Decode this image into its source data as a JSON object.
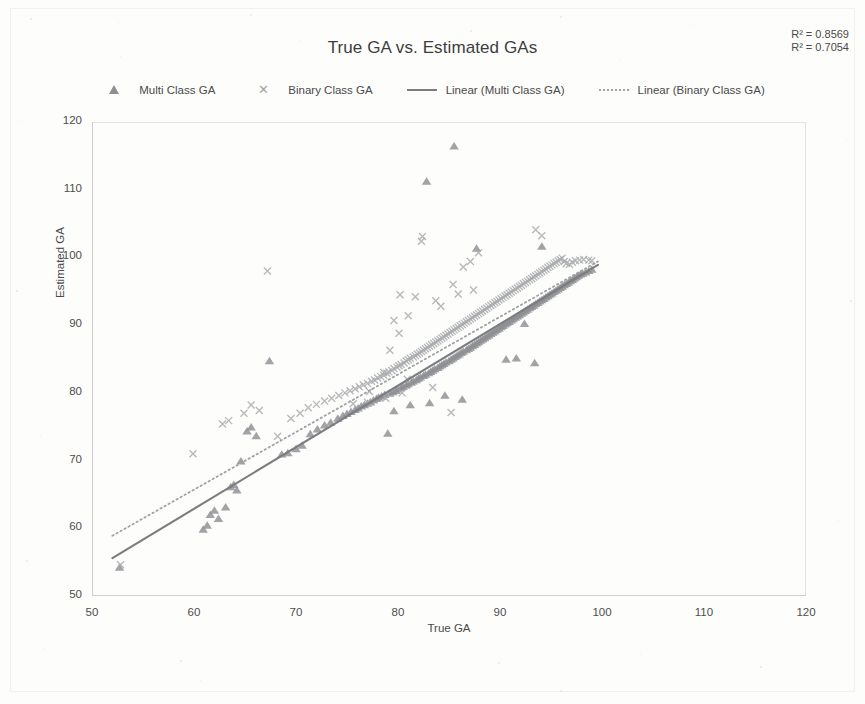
{
  "chart_data": {
    "type": "scatter",
    "title": "True GA vs. Estimated GAs",
    "xlabel": "True GA",
    "ylabel": "Estimated GA",
    "xlim": [
      50,
      120
    ],
    "ylim": [
      50,
      120
    ],
    "xticks": [
      50,
      60,
      70,
      80,
      90,
      100,
      110,
      120
    ],
    "yticks": [
      50,
      60,
      70,
      80,
      90,
      100,
      110,
      120
    ],
    "grid": false,
    "legend_position": "top",
    "annotations": [
      {
        "name": "r2-multi",
        "text": "R² = 0.8569",
        "value": 0.8569
      },
      {
        "name": "r2-binary",
        "text": "R² = 0.7054",
        "value": 0.7054
      }
    ],
    "colors": {
      "multi_marker": "#8d8f92",
      "binary_marker": "#a9abae",
      "multi_trend": "#7b7d80",
      "binary_trend": "#a0a2a5",
      "axis": "#cfcfcf",
      "text": "#4a4a4a"
    },
    "series": [
      {
        "name": "Multi Class GA",
        "marker": "triangle",
        "color": "#8d8f92",
        "points": [
          [
            52.7,
            54.2
          ],
          [
            60.9,
            59.8
          ],
          [
            61.3,
            60.4
          ],
          [
            61.6,
            62.0
          ],
          [
            62.0,
            62.6
          ],
          [
            62.4,
            61.4
          ],
          [
            63.1,
            63.1
          ],
          [
            63.6,
            66.1
          ],
          [
            63.9,
            66.4
          ],
          [
            64.2,
            65.6
          ],
          [
            64.6,
            69.9
          ],
          [
            65.2,
            74.3
          ],
          [
            65.6,
            74.9
          ],
          [
            66.1,
            73.6
          ],
          [
            67.4,
            84.7
          ],
          [
            68.6,
            70.9
          ],
          [
            69.2,
            71.1
          ],
          [
            70.0,
            71.7
          ],
          [
            70.6,
            72.2
          ],
          [
            71.4,
            73.9
          ],
          [
            72.1,
            74.6
          ],
          [
            72.8,
            75.2
          ],
          [
            73.4,
            75.6
          ],
          [
            74.1,
            76.2
          ],
          [
            74.6,
            76.6
          ],
          [
            75.0,
            76.9
          ],
          [
            75.4,
            77.2
          ],
          [
            75.8,
            77.5
          ],
          [
            76.1,
            77.7
          ],
          [
            76.4,
            78.0
          ],
          [
            76.7,
            78.2
          ],
          [
            77.0,
            78.4
          ],
          [
            77.3,
            78.6
          ],
          [
            77.6,
            78.9
          ],
          [
            77.9,
            79.1
          ],
          [
            78.1,
            79.3
          ],
          [
            78.4,
            79.5
          ],
          [
            78.7,
            79.7
          ],
          [
            79.0,
            74.0
          ],
          [
            79.2,
            79.9
          ],
          [
            79.5,
            80.1
          ],
          [
            79.8,
            80.3
          ],
          [
            80.0,
            80.5
          ],
          [
            80.3,
            80.7
          ],
          [
            80.5,
            80.9
          ],
          [
            80.8,
            81.1
          ],
          [
            81.0,
            81.3
          ],
          [
            81.3,
            81.5
          ],
          [
            81.5,
            81.7
          ],
          [
            81.8,
            81.9
          ],
          [
            82.0,
            82.1
          ],
          [
            82.2,
            82.3
          ],
          [
            82.5,
            82.5
          ],
          [
            82.7,
            82.7
          ],
          [
            82.8,
            111.2
          ],
          [
            83.0,
            82.9
          ],
          [
            83.2,
            83.1
          ],
          [
            83.4,
            83.3
          ],
          [
            83.6,
            83.5
          ],
          [
            83.9,
            83.7
          ],
          [
            84.1,
            83.9
          ],
          [
            84.3,
            84.1
          ],
          [
            84.5,
            84.3
          ],
          [
            84.7,
            84.5
          ],
          [
            85.0,
            84.7
          ],
          [
            85.2,
            84.9
          ],
          [
            85.4,
            85.1
          ],
          [
            85.5,
            116.4
          ],
          [
            85.6,
            85.3
          ],
          [
            85.8,
            85.5
          ],
          [
            86.0,
            85.7
          ],
          [
            86.2,
            85.9
          ],
          [
            86.4,
            86.1
          ],
          [
            86.7,
            86.3
          ],
          [
            86.9,
            86.5
          ],
          [
            87.1,
            86.7
          ],
          [
            87.3,
            86.9
          ],
          [
            87.5,
            87.1
          ],
          [
            87.7,
            87.3
          ],
          [
            87.7,
            101.3
          ],
          [
            87.9,
            87.5
          ],
          [
            88.1,
            87.7
          ],
          [
            88.3,
            87.9
          ],
          [
            88.5,
            88.1
          ],
          [
            88.7,
            88.3
          ],
          [
            88.9,
            88.5
          ],
          [
            89.1,
            88.7
          ],
          [
            89.3,
            88.9
          ],
          [
            89.5,
            89.1
          ],
          [
            89.7,
            89.3
          ],
          [
            89.9,
            89.5
          ],
          [
            90.1,
            89.7
          ],
          [
            90.3,
            89.9
          ],
          [
            90.5,
            90.1
          ],
          [
            90.7,
            90.3
          ],
          [
            90.9,
            90.5
          ],
          [
            91.1,
            90.7
          ],
          [
            91.3,
            90.9
          ],
          [
            91.5,
            91.1
          ],
          [
            91.7,
            91.3
          ],
          [
            91.6,
            85.1
          ],
          [
            91.9,
            91.5
          ],
          [
            92.1,
            91.7
          ],
          [
            92.3,
            91.9
          ],
          [
            92.5,
            92.1
          ],
          [
            92.7,
            92.3
          ],
          [
            92.9,
            92.5
          ],
          [
            93.1,
            92.7
          ],
          [
            93.3,
            92.9
          ],
          [
            93.5,
            93.1
          ],
          [
            93.4,
            84.4
          ],
          [
            93.7,
            93.3
          ],
          [
            93.9,
            93.5
          ],
          [
            94.1,
            93.7
          ],
          [
            94.3,
            93.9
          ],
          [
            94.5,
            94.1
          ],
          [
            94.7,
            94.3
          ],
          [
            94.9,
            94.5
          ],
          [
            95.1,
            94.7
          ],
          [
            95.3,
            94.9
          ],
          [
            95.5,
            95.1
          ],
          [
            95.7,
            95.3
          ],
          [
            95.9,
            95.5
          ],
          [
            96.1,
            95.7
          ],
          [
            96.3,
            95.9
          ],
          [
            96.5,
            96.1
          ],
          [
            96.7,
            96.3
          ],
          [
            96.9,
            96.5
          ],
          [
            97.1,
            96.7
          ],
          [
            97.3,
            96.9
          ],
          [
            97.5,
            97.1
          ],
          [
            97.7,
            97.3
          ],
          [
            97.9,
            97.5
          ],
          [
            98.1,
            97.6
          ],
          [
            98.4,
            97.8
          ],
          [
            98.7,
            98.0
          ],
          [
            99.0,
            98.2
          ],
          [
            94.1,
            101.6
          ],
          [
            92.4,
            90.2
          ],
          [
            90.6,
            84.9
          ],
          [
            86.3,
            79.0
          ],
          [
            84.6,
            79.6
          ],
          [
            83.1,
            78.5
          ],
          [
            81.2,
            78.2
          ],
          [
            79.6,
            77.3
          ]
        ]
      },
      {
        "name": "Binary Class GA",
        "marker": "cross",
        "color": "#a9abae",
        "points": [
          [
            52.8,
            54.6
          ],
          [
            59.9,
            71.0
          ],
          [
            62.8,
            75.4
          ],
          [
            63.4,
            75.9
          ],
          [
            64.9,
            77.0
          ],
          [
            65.6,
            78.2
          ],
          [
            66.4,
            77.4
          ],
          [
            67.2,
            98.0
          ],
          [
            68.2,
            73.6
          ],
          [
            69.5,
            76.2
          ],
          [
            70.4,
            77.0
          ],
          [
            71.2,
            77.8
          ],
          [
            72.0,
            78.3
          ],
          [
            72.8,
            78.8
          ],
          [
            73.5,
            79.2
          ],
          [
            74.2,
            79.6
          ],
          [
            74.8,
            80.0
          ],
          [
            75.3,
            80.3
          ],
          [
            75.8,
            80.6
          ],
          [
            76.2,
            80.9
          ],
          [
            76.6,
            81.2
          ],
          [
            77.0,
            81.4
          ],
          [
            77.4,
            81.7
          ],
          [
            77.7,
            81.9
          ],
          [
            78.0,
            82.2
          ],
          [
            78.3,
            82.4
          ],
          [
            78.6,
            82.6
          ],
          [
            78.9,
            82.9
          ],
          [
            79.1,
            83.1
          ],
          [
            79.4,
            83.3
          ],
          [
            79.6,
            83.6
          ],
          [
            79.9,
            83.8
          ],
          [
            80.1,
            84.0
          ],
          [
            80.1,
            88.8
          ],
          [
            80.3,
            84.2
          ],
          [
            80.6,
            84.4
          ],
          [
            80.8,
            84.7
          ],
          [
            81.0,
            84.9
          ],
          [
            81.0,
            91.4
          ],
          [
            81.2,
            85.1
          ],
          [
            81.5,
            85.3
          ],
          [
            81.7,
            85.5
          ],
          [
            81.7,
            94.2
          ],
          [
            81.9,
            85.7
          ],
          [
            82.1,
            85.9
          ],
          [
            82.3,
            86.1
          ],
          [
            82.3,
            102.4
          ],
          [
            82.5,
            86.3
          ],
          [
            82.4,
            103.1
          ],
          [
            82.7,
            86.5
          ],
          [
            82.9,
            86.7
          ],
          [
            83.1,
            86.9
          ],
          [
            83.3,
            87.1
          ],
          [
            83.5,
            87.3
          ],
          [
            83.7,
            87.5
          ],
          [
            83.9,
            87.7
          ],
          [
            84.1,
            87.9
          ],
          [
            84.2,
            92.8
          ],
          [
            84.3,
            88.1
          ],
          [
            84.5,
            88.3
          ],
          [
            84.7,
            88.5
          ],
          [
            84.9,
            88.7
          ],
          [
            85.1,
            88.9
          ],
          [
            85.3,
            89.1
          ],
          [
            85.4,
            96.0
          ],
          [
            85.5,
            89.3
          ],
          [
            85.7,
            89.5
          ],
          [
            85.9,
            89.7
          ],
          [
            86.1,
            89.9
          ],
          [
            86.3,
            90.1
          ],
          [
            86.4,
            98.6
          ],
          [
            86.5,
            90.3
          ],
          [
            86.7,
            90.5
          ],
          [
            86.9,
            90.7
          ],
          [
            87.1,
            90.9
          ],
          [
            87.1,
            99.4
          ],
          [
            87.3,
            91.1
          ],
          [
            87.5,
            91.3
          ],
          [
            87.7,
            91.5
          ],
          [
            87.9,
            91.7
          ],
          [
            87.9,
            100.7
          ],
          [
            88.1,
            91.9
          ],
          [
            88.3,
            92.1
          ],
          [
            88.5,
            92.3
          ],
          [
            88.7,
            92.5
          ],
          [
            88.9,
            92.7
          ],
          [
            89.1,
            92.9
          ],
          [
            89.3,
            93.1
          ],
          [
            89.5,
            93.3
          ],
          [
            89.7,
            93.5
          ],
          [
            89.9,
            93.7
          ],
          [
            90.1,
            93.9
          ],
          [
            90.3,
            94.1
          ],
          [
            90.5,
            94.3
          ],
          [
            90.7,
            94.5
          ],
          [
            90.9,
            94.7
          ],
          [
            91.1,
            94.9
          ],
          [
            91.3,
            95.1
          ],
          [
            91.5,
            95.3
          ],
          [
            91.7,
            95.5
          ],
          [
            91.9,
            95.7
          ],
          [
            92.1,
            95.9
          ],
          [
            92.3,
            96.1
          ],
          [
            92.5,
            96.3
          ],
          [
            92.7,
            96.5
          ],
          [
            92.9,
            96.7
          ],
          [
            93.1,
            96.9
          ],
          [
            93.3,
            97.1
          ],
          [
            93.5,
            97.3
          ],
          [
            93.7,
            97.5
          ],
          [
            93.5,
            104.1
          ],
          [
            93.9,
            97.7
          ],
          [
            94.1,
            97.9
          ],
          [
            94.3,
            98.1
          ],
          [
            94.5,
            98.3
          ],
          [
            94.1,
            103.2
          ],
          [
            94.7,
            98.5
          ],
          [
            94.9,
            98.7
          ],
          [
            95.1,
            98.9
          ],
          [
            95.3,
            99.1
          ],
          [
            95.5,
            99.3
          ],
          [
            95.7,
            99.5
          ],
          [
            95.9,
            99.7
          ],
          [
            96.1,
            99.9
          ],
          [
            96.3,
            99.4
          ],
          [
            96.5,
            99.1
          ],
          [
            96.8,
            99.0
          ],
          [
            97.1,
            99.3
          ],
          [
            97.4,
            99.5
          ],
          [
            97.8,
            99.6
          ],
          [
            98.2,
            99.7
          ],
          [
            98.7,
            99.6
          ],
          [
            99.0,
            99.5
          ],
          [
            85.2,
            77.1
          ],
          [
            80.4,
            80.0
          ],
          [
            78.8,
            79.2
          ],
          [
            77.2,
            80.2
          ],
          [
            83.4,
            80.8
          ],
          [
            80.9,
            82.0
          ],
          [
            79.2,
            86.3
          ],
          [
            79.6,
            90.7
          ],
          [
            80.2,
            94.5
          ],
          [
            78.6,
            83.0
          ],
          [
            77.0,
            78.6
          ],
          [
            75.6,
            78.4
          ],
          [
            83.7,
            93.6
          ],
          [
            85.9,
            94.6
          ],
          [
            87.4,
            95.2
          ]
        ]
      }
    ],
    "trendlines": [
      {
        "name": "Linear (Multi Class GA)",
        "style": "solid",
        "color": "#7b7d80",
        "x0": 52.0,
        "y0": 55.6,
        "x1": 99.6,
        "y1": 98.9
      },
      {
        "name": "Linear (Binary Class GA)",
        "style": "dotted",
        "color": "#a0a2a5",
        "x0": 52.0,
        "y0": 58.9,
        "x1": 99.6,
        "y1": 99.4
      }
    ],
    "legend": [
      {
        "label": "Multi Class GA",
        "key": "triangle-marker"
      },
      {
        "label": "Binary Class GA",
        "key": "cross-marker"
      },
      {
        "label": "Linear (Multi Class GA)",
        "key": "solid-line"
      },
      {
        "label": "Linear (Binary Class GA)",
        "key": "dotted-line"
      }
    ]
  }
}
